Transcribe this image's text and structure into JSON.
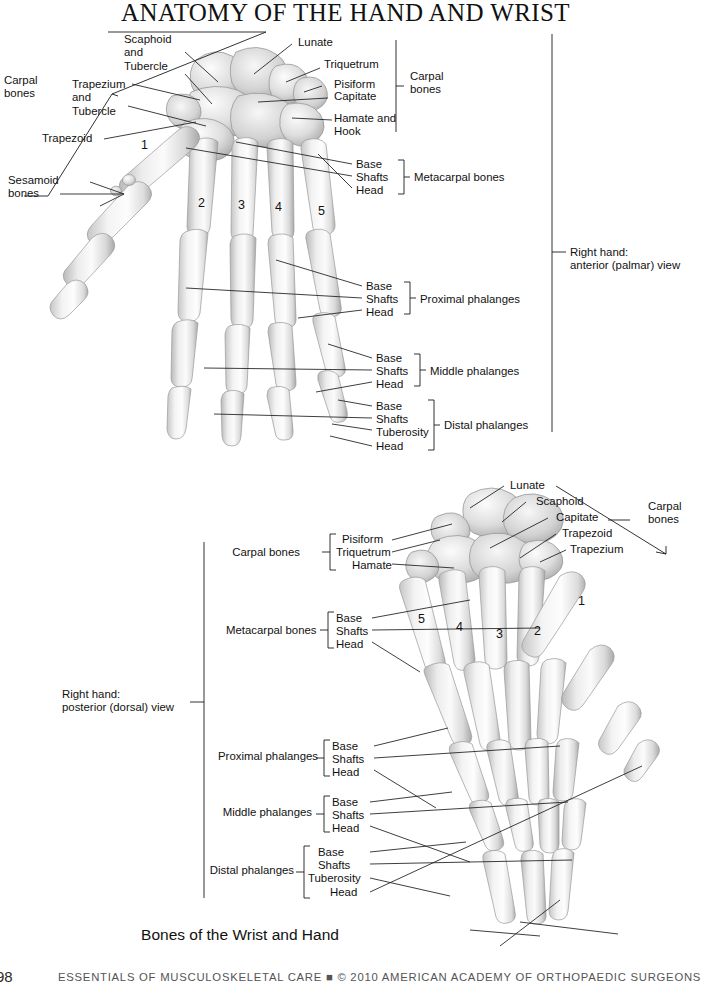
{
  "title": "ANATOMY OF THE HAND AND WRIST",
  "caption": "Bones of the Wrist and Hand",
  "footer": {
    "folio": "98",
    "line": "ESSENTIALS OF MUSCULOSKELETAL CARE   ■   © 2010 AMERICAN ACADEMY OF ORTHOPAEDIC SURGEONS"
  },
  "colors": {
    "ink": "#1a1a1a",
    "leader": "#1c1c1c",
    "bone_light": "#f2f2f2",
    "bone_mid": "#d8d8d8",
    "bone_dark": "#a9a9a9",
    "page": "#ffffff"
  },
  "palmar": {
    "view_label": "Right hand:\nanterior (palmar) view",
    "left_labels": [
      {
        "id": "carpal-bones-left",
        "text": "Carpal\nbones"
      },
      {
        "id": "scaphoid",
        "text": "Scaphoid\nand\nTubercle"
      },
      {
        "id": "trapezium",
        "text": "Trapezium\nand\nTubercle"
      },
      {
        "id": "trapezoid",
        "text": "Trapezoid"
      },
      {
        "id": "sesamoid-bones",
        "text": "Sesamoid\nbones"
      }
    ],
    "right_labels": [
      {
        "id": "lunate",
        "text": "Lunate"
      },
      {
        "id": "triquetrum",
        "text": "Triquetrum"
      },
      {
        "id": "pisiform",
        "text": "Pisiform"
      },
      {
        "id": "capitate",
        "text": "Capitate"
      },
      {
        "id": "hamate",
        "text": "Hamate and\nHook"
      }
    ],
    "carpal_group_label": "Carpal\nbones",
    "metacarpal_numbers": [
      "1",
      "2",
      "3",
      "4",
      "5"
    ],
    "groups": [
      {
        "id": "metacarpal-bones",
        "name": "Metacarpal bones",
        "parts": [
          "Base",
          "Shafts",
          "Head"
        ]
      },
      {
        "id": "proximal-phalanges",
        "name": "Proximal phalanges",
        "parts": [
          "Base",
          "Shafts",
          "Head"
        ]
      },
      {
        "id": "middle-phalanges",
        "name": "Middle phalanges",
        "parts": [
          "Base",
          "Shafts",
          "Head"
        ]
      },
      {
        "id": "distal-phalanges",
        "name": "Distal phalanges",
        "parts": [
          "Base",
          "Shafts",
          "Tuberosity",
          "Head"
        ]
      }
    ]
  },
  "dorsal": {
    "view_label": "Right hand:\nposterior (dorsal) view",
    "carpal_right_labels": [
      {
        "id": "lunate",
        "text": "Lunate"
      },
      {
        "id": "scaphoid",
        "text": "Scaphoid"
      },
      {
        "id": "capitate",
        "text": "Capitate"
      },
      {
        "id": "trapezoid",
        "text": "Trapezoid"
      },
      {
        "id": "trapezium",
        "text": "Trapezium"
      }
    ],
    "carpal_group_label": "Carpal\nbones",
    "carpal_left_group": {
      "name": "Carpal bones",
      "parts": [
        "Pisiform",
        "Triquetrum",
        "Hamate"
      ]
    },
    "metacarpal_numbers": [
      "5",
      "4",
      "3",
      "2",
      "1"
    ],
    "groups": [
      {
        "id": "metacarpal-bones",
        "name": "Metacarpal bones",
        "parts": [
          "Base",
          "Shafts",
          "Head"
        ]
      },
      {
        "id": "proximal-phalanges",
        "name": "Proximal phalanges",
        "parts": [
          "Base",
          "Shafts",
          "Head"
        ]
      },
      {
        "id": "middle-phalanges",
        "name": "Middle phalanges",
        "parts": [
          "Base",
          "Shafts",
          "Head"
        ]
      },
      {
        "id": "distal-phalanges",
        "name": "Distal phalanges",
        "parts": [
          "Base",
          "Shafts",
          "Tuberosity",
          "Head"
        ]
      }
    ]
  }
}
